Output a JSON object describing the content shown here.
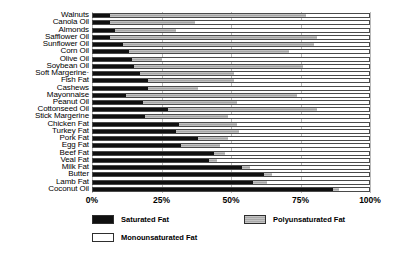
{
  "chart_data": {
    "type": "bar",
    "orientation": "horizontal",
    "stacked": true,
    "normalized_percent": true,
    "title": "",
    "subtitle": "",
    "xlabel": "",
    "ylabel": "",
    "xlim": [
      0,
      100
    ],
    "xticks": [
      "0%",
      "25%",
      "50%",
      "75%",
      "100%"
    ],
    "xtick_values": [
      0,
      25,
      50,
      75,
      100
    ],
    "grid": true,
    "grid_axis": "x",
    "legend_position": "below-plot",
    "categories": [
      "Walnuts",
      "Canola Oil",
      "Almonds",
      "Safflower Oil",
      "Sunflower Oil",
      "Corn Oil",
      "Olive Oil",
      "Soybean Oil",
      "Soft Margerine·",
      "Fish Fat",
      "Cashews",
      "Mayonnaise",
      "Peanut Oil",
      "Cottonseed Oil",
      "Stick Margerine",
      "Chicken Fat",
      "Turkey Fat",
      "Pork Fat",
      "Egg Fat",
      "Beef Fat",
      "Veal Fat",
      "Milk Fat",
      "Butter",
      "Lamb Fat",
      "Coconut Oil"
    ],
    "series": [
      {
        "name": "Saturated Fat",
        "color": "#101010",
        "values": [
          6,
          6,
          8,
          6,
          11,
          13,
          14,
          15,
          17,
          20,
          20,
          12,
          18,
          27,
          19,
          31,
          30,
          38,
          32,
          44,
          42,
          54,
          62,
          58,
          87
        ]
      },
      {
        "name": "Polyunsaturated Fat",
        "color": "#a8a8a8",
        "values": [
          71,
          31,
          22,
          75,
          69,
          58,
          11,
          61,
          34,
          31,
          18,
          62,
          34,
          54,
          30,
          21,
          23,
          11,
          14,
          4,
          3,
          3,
          3,
          5,
          2
        ]
      },
      {
        "name": "Monounsaturated Fat",
        "color": "#ffffff",
        "values": [
          23,
          63,
          70,
          19,
          20,
          29,
          75,
          24,
          49,
          49,
          62,
          26,
          48,
          19,
          51,
          48,
          47,
          51,
          54,
          52,
          55,
          43,
          35,
          37,
          11
        ]
      }
    ],
    "legend": [
      {
        "label": "Saturated Fat",
        "swatch": "sat"
      },
      {
        "label": "Polyunsaturated Fat",
        "swatch": "poly"
      },
      {
        "label": "Monounsaturated Fat",
        "swatch": "mono"
      }
    ]
  }
}
